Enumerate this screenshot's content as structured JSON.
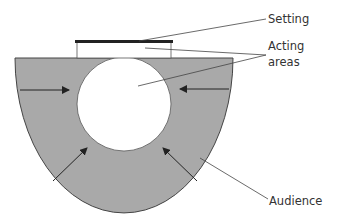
{
  "diagram": {
    "labels": {
      "setting": "Setting",
      "acting_line1": "Acting",
      "acting_line2": "areas",
      "audience": "Audience"
    },
    "colors": {
      "audience_fill": "#a9a9a9",
      "outline": "#333333",
      "background": "#ffffff"
    }
  }
}
